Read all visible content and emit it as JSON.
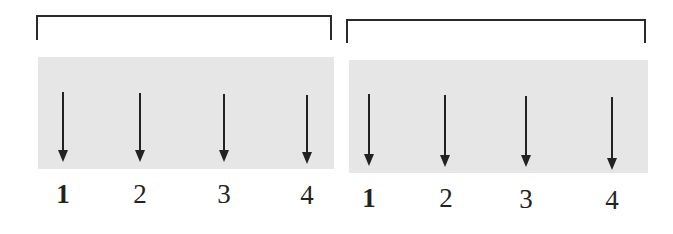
{
  "colors": {
    "ink": "#222222",
    "panel": "#e6e6e6",
    "background": "#ffffff"
  },
  "groups": [
    {
      "name": "group-left",
      "bracket": {
        "x": 36,
        "y": 15,
        "w": 296,
        "h": 25
      },
      "panel": {
        "x": 38,
        "y": 57,
        "w": 296,
        "h": 112
      },
      "arrows": [
        {
          "x": 63,
          "top": 92,
          "tip": 162
        },
        {
          "x": 140,
          "top": 93,
          "tip": 162
        },
        {
          "x": 224,
          "top": 94,
          "tip": 162
        },
        {
          "x": 307,
          "top": 95,
          "tip": 164
        }
      ],
      "labels": [
        {
          "text": "1",
          "x": 63,
          "y": 181,
          "bold": true
        },
        {
          "text": "2",
          "x": 140,
          "y": 181,
          "bold": false
        },
        {
          "text": "3",
          "x": 224,
          "y": 181,
          "bold": false
        },
        {
          "text": "4",
          "x": 307,
          "y": 182,
          "bold": false
        }
      ]
    },
    {
      "name": "group-right",
      "bracket": {
        "x": 346,
        "y": 19,
        "w": 300,
        "h": 24
      },
      "panel": {
        "x": 349,
        "y": 60,
        "w": 299,
        "h": 113
      },
      "arrows": [
        {
          "x": 369,
          "top": 94,
          "tip": 166
        },
        {
          "x": 445,
          "top": 95,
          "tip": 167
        },
        {
          "x": 526,
          "top": 96,
          "tip": 167
        },
        {
          "x": 612,
          "top": 97,
          "tip": 170
        }
      ],
      "labels": [
        {
          "text": "1",
          "x": 369,
          "y": 185,
          "bold": true
        },
        {
          "text": "2",
          "x": 446,
          "y": 185,
          "bold": false
        },
        {
          "text": "3",
          "x": 526,
          "y": 186,
          "bold": false
        },
        {
          "text": "4",
          "x": 612,
          "y": 187,
          "bold": false
        }
      ]
    }
  ]
}
